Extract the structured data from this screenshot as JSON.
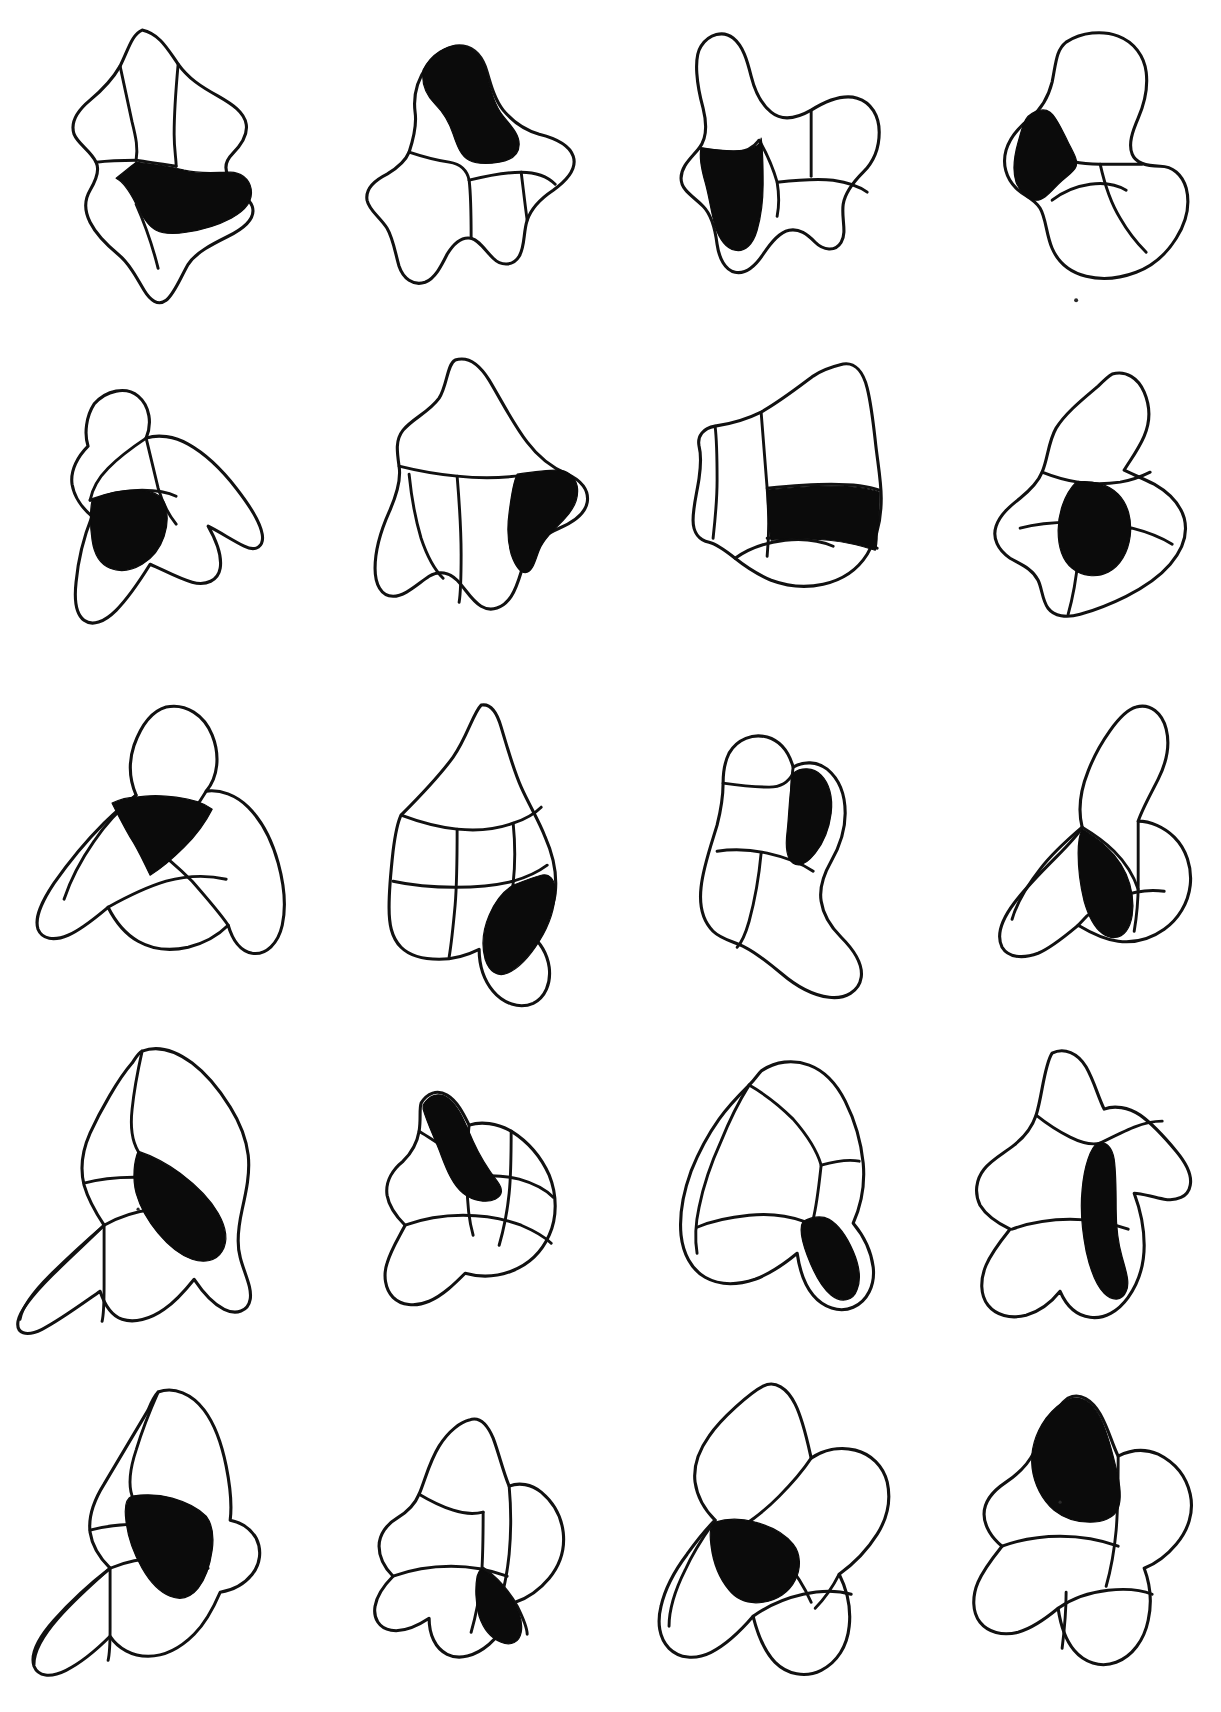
{
  "plate": {
    "kind": "scientific-illustration-plate",
    "description": "Plate of twenty hand-inked outline drawings of conodont platform elements; selected surface areas filled solid black.",
    "background_color": "#ffffff",
    "ink_color": "#111111",
    "fill_color": "#0b0b0b",
    "grid": {
      "rows": 5,
      "columns": 4,
      "total_figures": 20
    },
    "page_width": 1221,
    "page_height": 1712,
    "caption": "",
    "figures": [
      {
        "row": 1,
        "column": 1,
        "shape": "quadrate star-shaped element, four lobes",
        "black_region": "broad transverse band across lower middle",
        "black_area_fraction": 0.22
      },
      {
        "row": 1,
        "column": 2,
        "shape": "angular element with raised anterior process and two lower lobes",
        "black_region": "tall blade at upper centre",
        "black_area_fraction": 0.18
      },
      {
        "row": 1,
        "column": 3,
        "shape": "element with slender upswept left process and two right lobes",
        "black_region": "rounded block on lower left",
        "black_area_fraction": 0.17
      },
      {
        "row": 1,
        "column": 4,
        "shape": "broad rounded element with large upper lobe",
        "black_region": "crescent patch on left flank",
        "black_area_fraction": 0.14
      },
      {
        "row": 2,
        "column": 1,
        "shape": "hook-shaped element with small round cusp and long tapering horn",
        "black_region": "rounded patch at centre",
        "black_area_fraction": 0.13
      },
      {
        "row": 2,
        "column": 2,
        "shape": "large four-pointed diamond element",
        "black_region": "wedge at right corner",
        "black_area_fraction": 0.12
      },
      {
        "row": 2,
        "column": 3,
        "shape": "angular element, flared upper right process",
        "black_region": "wide horizontal band across middle",
        "black_area_fraction": 0.2
      },
      {
        "row": 2,
        "column": 4,
        "shape": "three-lobed element with narrow upper process",
        "black_region": "oval spot at centre",
        "black_area_fraction": 0.1
      },
      {
        "row": 3,
        "column": 1,
        "shape": "wing-shaped element with round cusp on top",
        "black_region": "triangular patch below cusp",
        "black_area_fraction": 0.11
      },
      {
        "row": 3,
        "column": 2,
        "shape": "teardrop element with transverse ribs",
        "black_region": "elongate drop on lower right",
        "black_area_fraction": 0.13
      },
      {
        "row": 3,
        "column": 3,
        "shape": "curved boot-shaped element",
        "black_region": "short band at upper middle",
        "black_area_fraction": 0.09
      },
      {
        "row": 3,
        "column": 4,
        "shape": "element with tall upper process and rounded right lobe",
        "black_region": "vertical wedge at lower centre",
        "black_area_fraction": 0.15
      },
      {
        "row": 4,
        "column": 1,
        "shape": "element with long pointed lower-left process",
        "black_region": "broad block on right of centre",
        "black_area_fraction": 0.19
      },
      {
        "row": 4,
        "column": 2,
        "shape": "small element with sharp dark spine above",
        "black_region": "pointed blade at top",
        "black_area_fraction": 0.17
      },
      {
        "row": 4,
        "column": 3,
        "shape": "element with arched upper lobe and descending process",
        "black_region": "vertical stripe running to lower right",
        "black_area_fraction": 0.15
      },
      {
        "row": 4,
        "column": 4,
        "shape": "four-lobed element with long central axis",
        "black_region": "tall narrow stripe down the centre",
        "black_area_fraction": 0.16
      },
      {
        "row": 5,
        "column": 1,
        "shape": "element with curved lower-left blade",
        "black_region": "square block at upper centre",
        "black_area_fraction": 0.15
      },
      {
        "row": 5,
        "column": 2,
        "shape": "narrow element with slender processes",
        "black_region": "small patch at lower centre",
        "black_area_fraction": 0.1
      },
      {
        "row": 5,
        "column": 3,
        "shape": "broad element with large left lobe and lower flanges",
        "black_region": "wedge left of centre",
        "black_area_fraction": 0.16
      },
      {
        "row": 5,
        "column": 4,
        "shape": "element with hooked dark upper-left process",
        "black_region": "thick hook at upper left",
        "black_area_fraction": 0.18
      }
    ]
  }
}
